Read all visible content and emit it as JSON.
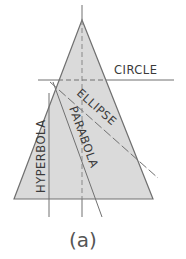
{
  "figure": {
    "caption": "(a)",
    "colors": {
      "cone_fill": "#d9d9d9",
      "line": "#6f6f6f",
      "text": "#3a3a3a"
    }
  },
  "labels": {
    "circle": "CIRCLE",
    "ellipse": "ELLIPSE",
    "parabola": "PARABOLA",
    "hyperbola": "HYPERBOLA"
  }
}
